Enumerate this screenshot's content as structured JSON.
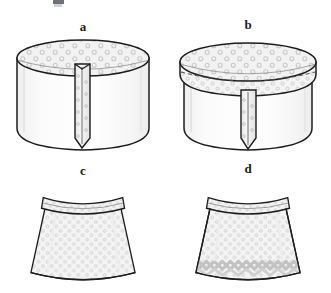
{
  "figure": {
    "kind": "sewing-instruction-diagram",
    "background_color": "#ffffff",
    "panel_count": 4
  },
  "panels": [
    {
      "id": "a",
      "label": "a",
      "name": "panel-a-fabric-tube-with-placket",
      "description": "Cylindrical fabric tube, patterned circular top opening, vertical patterned placket strip down the front with pointed lower end",
      "elements": {
        "body": "cylinder-body",
        "top": "patterned-ellipse-top",
        "strip": "vertical-placket-strip"
      }
    },
    {
      "id": "b",
      "label": "b",
      "name": "panel-b-tube-with-waistband-attached",
      "description": "Same fabric tube with a patterned waistband band folded over the top edge, dashed stitch line along the band, vertical placket strip below",
      "elements": {
        "body": "cylinder-body",
        "top": "patterned-ellipse-top",
        "band": "waistband-band",
        "stitch": "dashed-stitch-line",
        "strip": "vertical-placket-strip"
      }
    },
    {
      "id": "c",
      "label": "c",
      "name": "panel-c-finished-skirt",
      "description": "Finished A-line skirt, polka-dot patterned body, curved waistband at top, plain hem",
      "elements": {
        "body": "skirt-body",
        "band": "waistband-band",
        "hem": "plain-hem"
      }
    },
    {
      "id": "d",
      "label": "d",
      "name": "panel-d-finished-skirt-with-trim",
      "description": "Finished A-line skirt with polka-dot patterned body, curved waistband, and decorative zigzag ric-rac trim band above the hem",
      "elements": {
        "body": "skirt-body",
        "band": "waistband-band",
        "trim": "ric-rac-hem-trim"
      }
    }
  ],
  "style": {
    "outline_color": "#1c1c1c",
    "fabric_fill": "#f7f7f7",
    "pattern_fill": "#eeeeee",
    "dot_color": "#c4c4c4",
    "trim_color": "#bdbdbd",
    "shadow_color": "#e3e3e3",
    "label_color": "#1a1a1a"
  }
}
